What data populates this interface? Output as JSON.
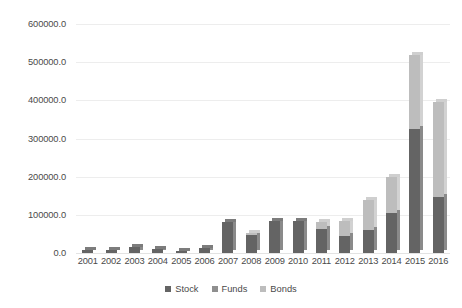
{
  "chart_data": {
    "type": "bar",
    "subtype": "stacked-column-3d",
    "title": "",
    "subtitle": "",
    "xlabel": "",
    "ylabel": "",
    "categories": [
      "2001",
      "2002",
      "2003",
      "2004",
      "2005",
      "2006",
      "2007",
      "2008",
      "2009",
      "2010",
      "2011",
      "2012",
      "2013",
      "2014",
      "2015",
      "2016"
    ],
    "series": [
      {
        "name": "Stock",
        "color": "#646464",
        "values": [
          7000,
          9000,
          17000,
          11000,
          6000,
          13000,
          82000,
          47000,
          85000,
          85000,
          64000,
          45000,
          60000,
          105000,
          325000,
          148000
        ]
      },
      {
        "name": "Funds",
        "color": "#8f8f8f",
        "values": [
          0,
          0,
          0,
          0,
          0,
          0,
          0,
          0,
          0,
          0,
          0,
          0,
          0,
          0,
          0,
          0
        ]
      },
      {
        "name": "Bonds",
        "color": "#bdbdbd",
        "values": [
          0,
          0,
          0,
          0,
          0,
          0,
          0,
          5000,
          0,
          0,
          17000,
          40000,
          80000,
          95000,
          195000,
          247000
        ]
      }
    ],
    "totals": [
      7000,
      9000,
      17000,
      11000,
      6000,
      13000,
      82000,
      52000,
      85000,
      85000,
      81000,
      85000,
      140000,
      200000,
      520000,
      395000
    ],
    "ylim": [
      0,
      600000
    ],
    "ytick_values": [
      0,
      100000,
      200000,
      300000,
      400000,
      500000,
      600000
    ],
    "ytick_labels": [
      "0.0",
      "100000.0",
      "200000.0",
      "300000.0",
      "400000.0",
      "500000.0",
      "600000.0"
    ],
    "grid": true,
    "legend_position": "bottom",
    "legend": [
      "Stock",
      "Funds",
      "Bonds"
    ]
  },
  "colors": {
    "stock": "#646464",
    "funds": "#8f8f8f",
    "bonds": "#bdbdbd",
    "gridline": "#ededed",
    "text": "#4a4a4a",
    "background": "#ffffff"
  }
}
